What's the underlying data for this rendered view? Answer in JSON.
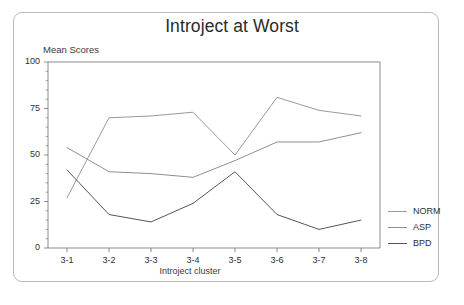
{
  "chart_data": {
    "type": "line",
    "title": "Introject at Worst",
    "xlabel": "Introject cluster",
    "ylabel": "Mean Scores",
    "ylim": [
      0,
      100
    ],
    "yticks": [
      0,
      25,
      50,
      75,
      100
    ],
    "ytick_labels": [
      "0",
      "25",
      "50",
      "75",
      "100"
    ],
    "categories": [
      "3-1",
      "3-2",
      "3-3",
      "3-4",
      "3-5",
      "3-6",
      "3-7",
      "3-8"
    ],
    "grid": false,
    "legend_position": "right",
    "series": [
      {
        "name": "NORM",
        "color": "#9a9a9a",
        "values": [
          27,
          70,
          71,
          73,
          50,
          81,
          74,
          71
        ]
      },
      {
        "name": "ASP",
        "color": "#8f8f8f",
        "values": [
          54,
          41,
          40,
          38,
          47,
          57,
          57,
          62
        ]
      },
      {
        "name": "BPD",
        "color": "#555555",
        "values": [
          42,
          18,
          14,
          24,
          41,
          18,
          10,
          15
        ]
      }
    ]
  },
  "legend": {
    "items": [
      {
        "label": "NORM"
      },
      {
        "label": "ASP"
      },
      {
        "label": "BPD"
      }
    ]
  },
  "colors": {
    "frame": "#b9b9b9",
    "axis": "#6f6f6f",
    "text": "#2f2f2f"
  }
}
